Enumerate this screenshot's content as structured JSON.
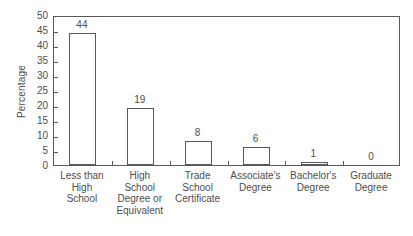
{
  "chart_data": {
    "type": "bar",
    "title": "",
    "xlabel": "",
    "ylabel": "Percentage",
    "ylim": [
      0,
      50
    ],
    "ytick_step": 5,
    "yticks": [
      50,
      45,
      40,
      35,
      30,
      25,
      20,
      15,
      10,
      5,
      0
    ],
    "grid": false,
    "legend": null,
    "categories": [
      "Less than High School",
      "High School Degree or Equivalent",
      "Trade School Certificate",
      "Associate's Degree",
      "Bachelor's Degree",
      "Graduate Degree"
    ],
    "category_lines": [
      [
        "Less than",
        "High",
        "School"
      ],
      [
        "High",
        "School",
        "Degree or",
        "Equivalent"
      ],
      [
        "Trade",
        "School",
        "Certificate"
      ],
      [
        "Associate's",
        "Degree"
      ],
      [
        "Bachelor's",
        "Degree"
      ],
      [
        "Graduate",
        "Degree"
      ]
    ],
    "values": [
      44,
      19,
      8,
      6,
      1,
      0
    ],
    "value_labels": [
      "44",
      "19",
      "8",
      "6",
      "1",
      "0"
    ],
    "bar_fill": "#ffffff",
    "bar_stroke": "#59595c",
    "axis_color": "#59595c",
    "text_color": "#4d4d4d",
    "background": "#ffffff"
  }
}
